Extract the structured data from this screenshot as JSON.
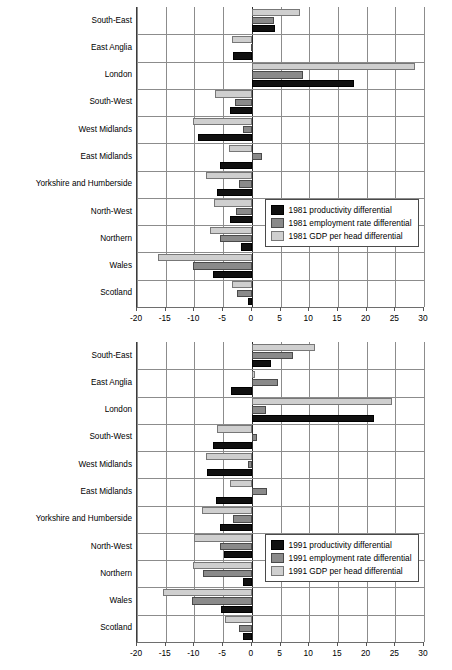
{
  "chart_data": [
    {
      "type": "bar",
      "orientation": "horizontal",
      "title": "",
      "xlabel": "",
      "ylabel": "",
      "xlim": [
        -20,
        30
      ],
      "xticks": [
        -20,
        -15,
        -10,
        -5,
        0,
        5,
        10,
        15,
        20,
        25,
        30
      ],
      "xticklabels": [
        "-20",
        "-15",
        "-10",
        "-5",
        "0",
        "5",
        "10",
        "15",
        "20",
        "25",
        "30"
      ],
      "grid": true,
      "legend_position": "center-right",
      "categories": [
        "South-East",
        "East Anglia",
        "London",
        "South-West",
        "West Midlands",
        "East Midlands",
        "Yorkshire and Humberside",
        "North-West",
        "Northern",
        "Wales",
        "Scotland"
      ],
      "series": [
        {
          "name": "1981 productivity differential",
          "color": "#101010",
          "values": [
            4.0,
            -3.2,
            17.8,
            -3.8,
            -9.3,
            -5.5,
            -6.0,
            -3.8,
            -1.8,
            -6.8,
            -0.6
          ]
        },
        {
          "name": "1981 employment rate differential",
          "color": "#8a8a8a",
          "values": [
            3.8,
            -0.2,
            9.0,
            -3.0,
            -1.5,
            1.8,
            -2.3,
            -2.8,
            -5.5,
            -10.2,
            -2.5
          ]
        },
        {
          "name": "1981 GDP per head differential",
          "color": "#cfcfcf",
          "values": [
            8.4,
            -3.5,
            28.4,
            -6.4,
            -10.2,
            -4.0,
            -8.0,
            -6.6,
            -7.3,
            -16.3,
            -3.4
          ]
        }
      ]
    },
    {
      "type": "bar",
      "orientation": "horizontal",
      "title": "",
      "xlabel": "",
      "ylabel": "",
      "xlim": [
        -20,
        30
      ],
      "xticks": [
        -20,
        -15,
        -10,
        -5,
        0,
        5,
        10,
        15,
        20,
        25,
        30
      ],
      "xticklabels": [
        "-20",
        "-15",
        "-10",
        "-5",
        "0",
        "5",
        "10",
        "15",
        "20",
        "25",
        "30"
      ],
      "grid": true,
      "legend_position": "center-right",
      "categories": [
        "South-East",
        "East Anglia",
        "London",
        "South-West",
        "West Midlands",
        "East Midlands",
        "Yorkshire and Humberside",
        "North-West",
        "Northern",
        "Wales",
        "Scotland"
      ],
      "series": [
        {
          "name": "1991 productivity differential",
          "color": "#101010",
          "values": [
            3.4,
            -3.6,
            21.3,
            -6.7,
            -7.8,
            -6.2,
            -5.5,
            -4.8,
            -1.6,
            -5.3,
            -1.5
          ]
        },
        {
          "name": "1991 employment rate differential",
          "color": "#8a8a8a",
          "values": [
            7.2,
            4.5,
            2.4,
            0.9,
            -0.6,
            2.6,
            -3.2,
            -5.5,
            -8.5,
            -10.5,
            -2.3
          ]
        },
        {
          "name": "1991 GDP per head differential",
          "color": "#cfcfcf",
          "values": [
            11.0,
            0.6,
            24.4,
            -6.0,
            -8.0,
            -3.8,
            -8.6,
            -10.0,
            -10.2,
            -15.4,
            -4.6
          ]
        }
      ]
    }
  ]
}
